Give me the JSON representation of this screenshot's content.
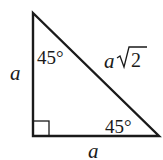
{
  "diagram": {
    "type": "right-triangle",
    "vertical_leg_label": "a",
    "horizontal_leg_label": "a",
    "hypotenuse_label_var": "a",
    "hypotenuse_label_root": "2",
    "top_angle_label": "45°",
    "bottom_right_angle_label": "45°",
    "right_angle_marker": true,
    "stroke_color": "#1a1a1a"
  }
}
